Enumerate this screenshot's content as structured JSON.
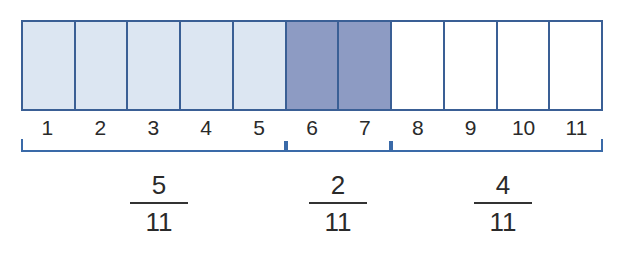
{
  "diagram": {
    "total_parts": 11,
    "colors": {
      "border": "#3a5f95",
      "light_fill": "#dce6f2",
      "dark_fill": "#8d9bc3",
      "empty_fill": "#ffffff",
      "bracket": "#3a6aa8",
      "text": "#2a2a2a"
    },
    "cells": [
      {
        "label": "1",
        "fill": "#dce6f2",
        "group": "light"
      },
      {
        "label": "2",
        "fill": "#dce6f2",
        "group": "light"
      },
      {
        "label": "3",
        "fill": "#dce6f2",
        "group": "light"
      },
      {
        "label": "4",
        "fill": "#dce6f2",
        "group": "light"
      },
      {
        "label": "5",
        "fill": "#dce6f2",
        "group": "light"
      },
      {
        "label": "6",
        "fill": "#8d9bc3",
        "group": "dark"
      },
      {
        "label": "7",
        "fill": "#8d9bc3",
        "group": "dark"
      },
      {
        "label": "8",
        "fill": "#ffffff",
        "group": "empty"
      },
      {
        "label": "9",
        "fill": "#ffffff",
        "group": "empty"
      },
      {
        "label": "10",
        "fill": "#ffffff",
        "group": "empty"
      },
      {
        "label": "11",
        "fill": "#ffffff",
        "group": "empty"
      }
    ],
    "groups": [
      {
        "name": "light",
        "start": 1,
        "end": 5,
        "numerator": "5",
        "denominator": "11"
      },
      {
        "name": "dark",
        "start": 6,
        "end": 7,
        "numerator": "2",
        "denominator": "11"
      },
      {
        "name": "empty",
        "start": 8,
        "end": 11,
        "numerator": "4",
        "denominator": "11"
      }
    ]
  }
}
